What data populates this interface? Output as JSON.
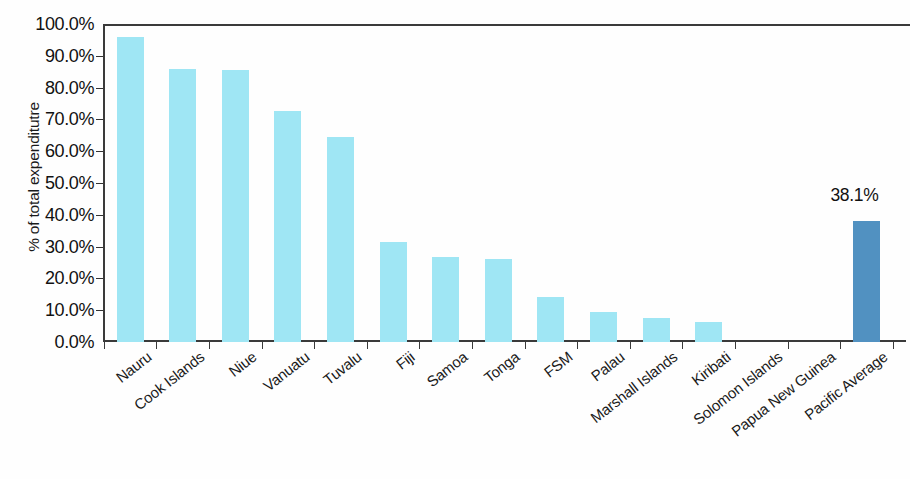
{
  "chart_data": {
    "type": "bar",
    "title": "",
    "xlabel": "",
    "ylabel": "% of total expenditutre",
    "ylim": [
      0,
      100
    ],
    "ytick_labels": [
      "100.0%",
      "90.0%",
      "80.0%",
      "70.0%",
      "60.0%",
      "50.0%",
      "40.0%",
      "30.0%",
      "20.0%",
      "10.0%",
      "0.0%"
    ],
    "ytick_values": [
      100,
      90,
      80,
      70,
      60,
      50,
      40,
      30,
      20,
      10,
      0
    ],
    "grid": false,
    "legend": null,
    "categories": [
      "Nauru",
      "Cook Islands",
      "Niue",
      "Vanuatu",
      "Tuvalu",
      "Fiji",
      "Samoa",
      "Tonga",
      "FSM",
      "Palau",
      "Marshall Islands",
      "Kiribati",
      "Solomon Islands",
      "Papua New Guinea",
      "Pacific Average"
    ],
    "values": [
      96.0,
      86.0,
      85.5,
      72.5,
      64.5,
      31.5,
      26.8,
      26.2,
      14.2,
      9.5,
      7.5,
      6.3,
      0,
      0,
      38.1
    ],
    "annotations": [
      {
        "category": "Pacific Average",
        "text": "38.1%",
        "value": 38.1
      }
    ],
    "colors": {
      "bar_default": "#9FE6F4",
      "bar_highlight": "#5191C1",
      "axis": "#3a3a3a",
      "text": "#1a1a1a",
      "background": "#fefefe"
    },
    "highlight_category": "Pacific Average"
  }
}
